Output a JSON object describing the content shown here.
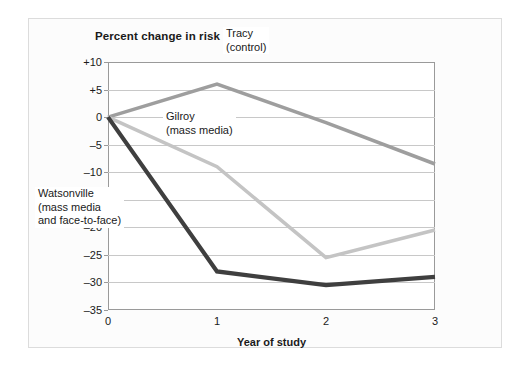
{
  "chart_data": {
    "type": "line",
    "title": "Percent change in risk",
    "xlabel": "Year of study",
    "ylabel": "",
    "x": [
      0,
      1,
      2,
      3
    ],
    "xlim": [
      0,
      3
    ],
    "ylim": [
      -35,
      10
    ],
    "grid": true,
    "legend_position": "inline-annotations",
    "xticks": [
      "0",
      "1",
      "2",
      "3"
    ],
    "yticks": [
      "+10",
      "+5",
      "0",
      "-5",
      "-10",
      "-15",
      "-20",
      "-25",
      "-30",
      "-35"
    ],
    "ytick_values": [
      10,
      5,
      0,
      -5,
      -10,
      -15,
      -20,
      -25,
      -30,
      -35
    ],
    "series": [
      {
        "name": "Tracy (control)",
        "label_line1": "Tracy",
        "label_line2": "(control)",
        "color": "#9e9e9e",
        "values": [
          0,
          6,
          -1,
          -8.5
        ]
      },
      {
        "name": "Gilroy (mass media)",
        "label_line1": "Gilroy",
        "label_line2": "(mass media)",
        "color": "#c4c4c4",
        "values": [
          0,
          -9,
          -25.5,
          -20.5
        ]
      },
      {
        "name": "Watsonville (mass media and face-to-face)",
        "label_line1": "Watsonville",
        "label_line2": "(mass media",
        "label_line3": "and face-to-face)",
        "color": "#3f3f3f",
        "values": [
          0,
          -28,
          -30.5,
          -29
        ]
      }
    ]
  },
  "colors": {
    "background": "#ffffff",
    "frame": "#dcdcdc",
    "axis": "#9a9a9a",
    "grid": "#c8c8c8",
    "text": "#1a1a1a",
    "tracy": "#9e9e9e",
    "gilroy": "#c4c4c4",
    "watsonville": "#3f3f3f"
  }
}
